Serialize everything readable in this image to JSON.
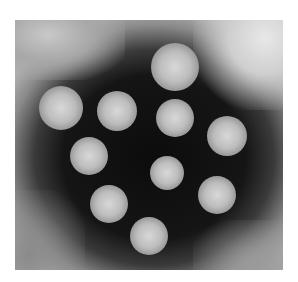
{
  "image": {
    "subject": "negative-stain electron micrograph of icosahedral virus particles",
    "particle_count": 10,
    "colors": {
      "background": "#ffffff",
      "stain": "#111111",
      "particle": "#c8c8c8"
    },
    "particles": [
      {
        "x": 160,
        "y": 47,
        "r": 24
      },
      {
        "x": 46,
        "y": 88,
        "r": 22
      },
      {
        "x": 102,
        "y": 91,
        "r": 20
      },
      {
        "x": 160,
        "y": 98,
        "r": 19
      },
      {
        "x": 212,
        "y": 116,
        "r": 20
      },
      {
        "x": 74,
        "y": 136,
        "r": 19
      },
      {
        "x": 152,
        "y": 153,
        "r": 17
      },
      {
        "x": 202,
        "y": 175,
        "r": 19
      },
      {
        "x": 94,
        "y": 184,
        "r": 19
      },
      {
        "x": 134,
        "y": 216,
        "r": 19
      }
    ]
  }
}
